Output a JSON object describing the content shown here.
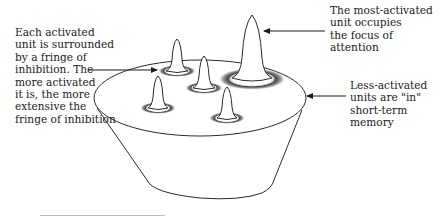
{
  "diagram": {
    "labels": {
      "fringe_of_inhibition": "Each activated\nunit is surrounded\nby a fringe of\ninhibition. The\nmore activated\nit is, the more\nextensive the\nfringe of inhibition",
      "focus_of_attention": "The most-activated\nunit occupies\nthe focus of\nattention",
      "short_term_memory": "Less-activated\nunits are \"in\"\nshort-term memory"
    },
    "elements": {
      "container": "bucket representing long-term memory store",
      "units": [
        {
          "name": "most-activated-unit",
          "height": "tall",
          "fringe": "wide"
        },
        {
          "name": "activated-unit-back-left",
          "height": "medium",
          "fringe": "narrow"
        },
        {
          "name": "activated-unit-center",
          "height": "medium",
          "fringe": "narrow"
        },
        {
          "name": "activated-unit-front-left",
          "height": "medium",
          "fringe": "narrow"
        },
        {
          "name": "activated-unit-front-right",
          "height": "medium",
          "fringe": "narrow"
        }
      ]
    },
    "colors": {
      "stroke": "#2b2b2b",
      "fringe": "#555555",
      "text": "#1a1a1a"
    }
  }
}
